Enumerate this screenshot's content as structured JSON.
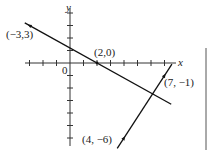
{
  "diagram": {
    "type": "coordinate-plane",
    "axes": {
      "x_label": "x",
      "y_label": "y",
      "origin_label": "0",
      "x_range": [
        -4,
        7.5
      ],
      "y_range": [
        -6.5,
        4.5
      ]
    },
    "lines": [
      {
        "name": "line-1",
        "through": [
          [
            -3,
            3
          ],
          [
            2,
            0
          ]
        ],
        "slope": "-3/5"
      },
      {
        "name": "line-2",
        "through": [
          [
            4,
            -6
          ],
          [
            7,
            -1
          ]
        ],
        "slope": "5/3"
      }
    ],
    "point_labels": [
      {
        "name": "point-label-neg3-3",
        "text": "(−3,3)"
      },
      {
        "name": "point-label-2-0",
        "text": "(2,0)"
      },
      {
        "name": "point-label-7-neg1",
        "text": "(7, −1)"
      },
      {
        "name": "point-label-4-neg6",
        "text": "(4, −6)"
      }
    ]
  }
}
